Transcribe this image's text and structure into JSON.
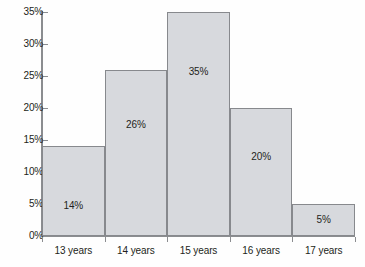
{
  "chart_data": {
    "type": "bar",
    "title": "",
    "subtitle": "",
    "xlabel": "",
    "ylabel": "",
    "categories": [
      "13 years",
      "14 years",
      "15 years",
      "16 years",
      "17 years"
    ],
    "values": [
      14,
      26,
      35,
      20,
      5
    ],
    "value_labels": [
      "14%",
      "26%",
      "35%",
      "20%",
      "5%"
    ],
    "ylim": [
      0,
      35
    ],
    "ytick_values": [
      0,
      5,
      10,
      15,
      20,
      25,
      30,
      35
    ],
    "ytick_labels": [
      "0%",
      "5%",
      "10%",
      "15%",
      "20%",
      "25%",
      "30%",
      "35%"
    ],
    "grid": false,
    "legend": null,
    "bar_fill_color": "#d7d9dd",
    "bar_border_color": "#87898d",
    "axis_color": "#8b8d90",
    "text_color": "#231f20",
    "background_color": "#fefefe"
  }
}
